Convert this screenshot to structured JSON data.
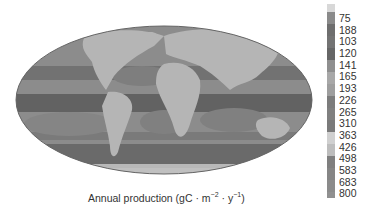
{
  "map": {
    "projection": "mollweide",
    "subject": "Global ocean primary production",
    "colors": {
      "land": "#b5b5b5",
      "ocean_low": "#8c8c8c",
      "ocean_mid": "#7a7a7a",
      "ocean_high": "#5e5e5e",
      "outline": "#666666"
    }
  },
  "colorbar": {
    "labels": [
      "75",
      "188",
      "103",
      "120",
      "141",
      "165",
      "193",
      "226",
      "265",
      "310",
      "363",
      "426",
      "498",
      "583",
      "683",
      "800"
    ],
    "segment_colors": [
      "#d8d8d8",
      "#8a8a8a",
      "#6e6e6e",
      "#737373",
      "#666666",
      "#8f8f8f",
      "#a8a8a8",
      "#9e9e9e",
      "#7c7c7c",
      "#808080",
      "#7a7a7a",
      "#d0d0d0",
      "#bdbdbd",
      "#7f7f7f",
      "#858585",
      "#8b8b8b",
      "#909090"
    ]
  },
  "caption": {
    "prefix": "Annual production (gC · m",
    "exp1": "−2",
    "mid": " · y",
    "exp2": "−1",
    "suffix": ")"
  }
}
